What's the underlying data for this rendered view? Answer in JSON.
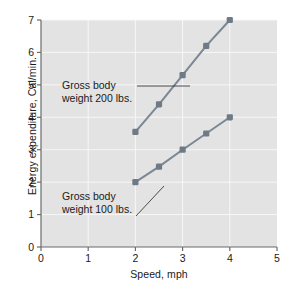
{
  "chart_data": {
    "type": "line",
    "title": "",
    "xlabel": "Speed, mph",
    "ylabel": "Energy expenditure, Cal/min.",
    "xlim": [
      0,
      5
    ],
    "ylim": [
      0,
      7
    ],
    "xticks": [
      "0",
      "1",
      "2",
      "3",
      "4",
      "5"
    ],
    "yticks": [
      "0",
      "1",
      "2",
      "3",
      "4",
      "5",
      "6",
      "7"
    ],
    "grid": true,
    "legend_position": "inline-annotations",
    "series": [
      {
        "name": "Gross body weight 200 lbs.",
        "x": [
          2,
          2.5,
          3,
          3.5,
          4
        ],
        "values": [
          3.55,
          4.4,
          5.3,
          6.2,
          7.0
        ]
      },
      {
        "name": "Gross body weight 100 lbs.",
        "x": [
          2,
          2.5,
          3,
          3.5,
          4
        ],
        "values": [
          2.0,
          2.48,
          3.0,
          3.5,
          4.0
        ]
      }
    ],
    "annotations": [
      {
        "line1": "Gross body",
        "line2": "weight 200 lbs."
      },
      {
        "line1": "Gross body",
        "line2": "weight 100 lbs."
      }
    ]
  },
  "colors": {
    "plot_background": "#e3e3e3",
    "gridline": "#f7f7f7",
    "axis": "#6b6b6b",
    "series": "#7b8793",
    "marker": "#6e7a86",
    "text": "#1a1a1a"
  }
}
